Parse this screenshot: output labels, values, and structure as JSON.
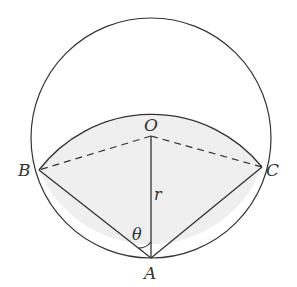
{
  "diagram": {
    "type": "geometry",
    "colors": {
      "stroke": "#333333",
      "shading": "#efefef",
      "background": "#ffffff"
    },
    "points": {
      "O": {
        "label": "O"
      },
      "A": {
        "label": "A"
      },
      "B": {
        "label": "B"
      },
      "C": {
        "label": "C"
      }
    },
    "labels": {
      "radius": "r",
      "angle": "θ"
    },
    "segments": [
      {
        "from": "A",
        "to": "B",
        "style": "solid"
      },
      {
        "from": "A",
        "to": "C",
        "style": "solid"
      },
      {
        "from": "A",
        "to": "O",
        "style": "solid",
        "label": "r"
      },
      {
        "from": "O",
        "to": "B",
        "style": "dashed"
      },
      {
        "from": "O",
        "to": "C",
        "style": "dashed"
      }
    ],
    "angles": [
      {
        "vertex": "A",
        "between": [
          "B",
          "O"
        ],
        "label": "θ"
      }
    ]
  }
}
